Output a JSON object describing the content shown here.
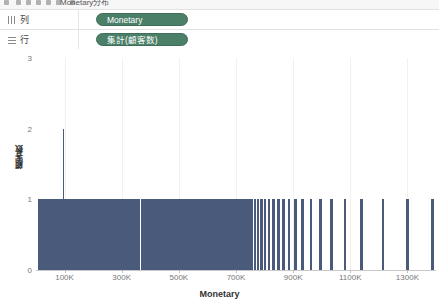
{
  "toolbar": {
    "title": "Monetary分布",
    "icons": [
      "menu-icon",
      "back-icon",
      "forward-icon",
      "save-icon",
      "undo-icon",
      "redo-icon",
      "new-sheet-icon"
    ]
  },
  "shelves": [
    {
      "label": "列",
      "icon": "columns-icon",
      "pill": "Monetary"
    },
    {
      "label": "行",
      "icon": "rows-icon",
      "pill": "集計(顧客数)"
    }
  ],
  "chart_data": {
    "type": "bar",
    "title": "",
    "xlabel": "Monetary",
    "ylabel": "顧客数",
    "xlim": [
      0,
      1400000
    ],
    "ylim": [
      0,
      3
    ],
    "grid": true,
    "legend": false,
    "bar_color": "#4a5a7a",
    "x_tick_labels": [
      "100K",
      "300K",
      "500K",
      "700K",
      "900K",
      "1100K",
      "1300K"
    ],
    "x_tick_values": [
      100000,
      300000,
      500000,
      700000,
      900000,
      1100000,
      1300000
    ],
    "y_tick_labels": [
      "0",
      "1",
      "2",
      "3"
    ],
    "y_tick_values": [
      0,
      1,
      2,
      3
    ],
    "note": "Histogram of distinct Monetary values; nearly all bins have count 1, one bin has count 2",
    "bars": [
      {
        "x": 8000,
        "w": 0.3,
        "y": 1
      },
      {
        "x": 11000,
        "w": 0.3,
        "y": 1
      },
      {
        "x": 14000,
        "w": 0.3,
        "y": 1
      },
      {
        "x": 17000,
        "w": 0.3,
        "y": 1
      },
      {
        "x": 20000,
        "w": 0.3,
        "y": 1
      },
      {
        "x": 23000,
        "w": 0.3,
        "y": 1
      },
      {
        "x": 26000,
        "w": 0.3,
        "y": 1
      },
      {
        "x": 29000,
        "w": 0.3,
        "y": 1
      },
      {
        "x": 32000,
        "w": 0.3,
        "y": 1
      },
      {
        "x": 35000,
        "w": 0.3,
        "y": 1
      },
      {
        "x": 38000,
        "w": 0.3,
        "y": 1
      },
      {
        "x": 41000,
        "w": 0.3,
        "y": 1
      },
      {
        "x": 44000,
        "w": 0.3,
        "y": 1
      },
      {
        "x": 47000,
        "w": 0.3,
        "y": 1
      },
      {
        "x": 50000,
        "w": 0.3,
        "y": 1
      },
      {
        "x": 53000,
        "w": 0.3,
        "y": 1
      },
      {
        "x": 56000,
        "w": 0.3,
        "y": 1
      },
      {
        "x": 59000,
        "w": 0.3,
        "y": 1
      },
      {
        "x": 62000,
        "w": 0.3,
        "y": 1
      },
      {
        "x": 65000,
        "w": 0.3,
        "y": 1
      },
      {
        "x": 68000,
        "w": 0.3,
        "y": 1
      },
      {
        "x": 71000,
        "w": 0.3,
        "y": 1
      },
      {
        "x": 74000,
        "w": 0.3,
        "y": 1
      },
      {
        "x": 77000,
        "w": 0.3,
        "y": 1
      },
      {
        "x": 80000,
        "w": 0.3,
        "y": 1
      },
      {
        "x": 83000,
        "w": 0.3,
        "y": 1
      },
      {
        "x": 86000,
        "w": 0.3,
        "y": 1
      },
      {
        "x": 89000,
        "w": 0.3,
        "y": 1
      },
      {
        "x": 92000,
        "w": 0.3,
        "y": 1
      },
      {
        "x": 95000,
        "w": 0.3,
        "y": 1
      },
      {
        "x": 98000,
        "w": 0.3,
        "y": 1
      },
      {
        "x": 101000,
        "w": 0.3,
        "y": 1
      },
      {
        "x": 104000,
        "w": 0.3,
        "y": 1
      },
      {
        "x": 107000,
        "w": 0.3,
        "y": 1
      },
      {
        "x": 110000,
        "w": 0.3,
        "y": 1
      },
      {
        "x": 113000,
        "w": 0.3,
        "y": 1
      },
      {
        "x": 116000,
        "w": 0.3,
        "y": 1
      },
      {
        "x": 119000,
        "w": 0.3,
        "y": 1
      },
      {
        "x": 122000,
        "w": 0.3,
        "y": 1
      },
      {
        "x": 125000,
        "w": 0.3,
        "y": 1
      },
      {
        "x": 128000,
        "w": 0.3,
        "y": 1
      },
      {
        "x": 131000,
        "w": 0.3,
        "y": 1
      },
      {
        "x": 134000,
        "w": 0.3,
        "y": 1
      },
      {
        "x": 137000,
        "w": 0.3,
        "y": 1
      },
      {
        "x": 140000,
        "w": 0.3,
        "y": 1
      },
      {
        "x": 143000,
        "w": 0.3,
        "y": 1
      },
      {
        "x": 146000,
        "w": 0.3,
        "y": 1
      },
      {
        "x": 149000,
        "w": 0.3,
        "y": 1
      },
      {
        "x": 152000,
        "w": 0.3,
        "y": 1
      },
      {
        "x": 155000,
        "w": 0.3,
        "y": 1
      },
      {
        "x": 158000,
        "w": 0.3,
        "y": 1
      },
      {
        "x": 161000,
        "w": 0.3,
        "y": 1
      },
      {
        "x": 164000,
        "w": 0.3,
        "y": 1
      },
      {
        "x": 167000,
        "w": 0.3,
        "y": 1
      },
      {
        "x": 170000,
        "w": 0.3,
        "y": 1
      },
      {
        "x": 173000,
        "w": 0.3,
        "y": 1
      },
      {
        "x": 176000,
        "w": 0.3,
        "y": 1
      },
      {
        "x": 179000,
        "w": 0.3,
        "y": 1
      },
      {
        "x": 182000,
        "w": 0.3,
        "y": 1
      },
      {
        "x": 185000,
        "w": 0.3,
        "y": 1
      },
      {
        "x": 188000,
        "w": 0.3,
        "y": 1
      },
      {
        "x": 191000,
        "w": 0.3,
        "y": 1
      },
      {
        "x": 194000,
        "w": 0.3,
        "y": 1
      },
      {
        "x": 197000,
        "w": 0.3,
        "y": 1
      },
      {
        "x": 200000,
        "w": 0.3,
        "y": 1
      },
      {
        "x": 203000,
        "w": 0.3,
        "y": 1
      },
      {
        "x": 206000,
        "w": 0.3,
        "y": 1
      },
      {
        "x": 209000,
        "w": 0.3,
        "y": 1
      },
      {
        "x": 212000,
        "w": 0.3,
        "y": 1
      },
      {
        "x": 215000,
        "w": 0.3,
        "y": 1
      },
      {
        "x": 218000,
        "w": 0.3,
        "y": 1
      },
      {
        "x": 221000,
        "w": 0.3,
        "y": 1
      },
      {
        "x": 224000,
        "w": 0.3,
        "y": 1
      },
      {
        "x": 227000,
        "w": 0.3,
        "y": 1
      },
      {
        "x": 230000,
        "w": 0.3,
        "y": 1
      },
      {
        "x": 233000,
        "w": 0.3,
        "y": 1
      },
      {
        "x": 236000,
        "w": 0.3,
        "y": 1
      },
      {
        "x": 239000,
        "w": 0.3,
        "y": 1
      },
      {
        "x": 242000,
        "w": 0.3,
        "y": 1
      },
      {
        "x": 245000,
        "w": 0.3,
        "y": 1
      },
      {
        "x": 248000,
        "w": 0.3,
        "y": 1
      },
      {
        "x": 251000,
        "w": 0.3,
        "y": 1
      },
      {
        "x": 254000,
        "w": 0.3,
        "y": 1
      },
      {
        "x": 257000,
        "w": 0.3,
        "y": 1
      },
      {
        "x": 260000,
        "w": 0.3,
        "y": 1
      },
      {
        "x": 263000,
        "w": 0.3,
        "y": 1
      },
      {
        "x": 266000,
        "w": 0.3,
        "y": 1
      },
      {
        "x": 269000,
        "w": 0.3,
        "y": 1
      },
      {
        "x": 272000,
        "w": 0.3,
        "y": 1
      },
      {
        "x": 275000,
        "w": 0.3,
        "y": 1
      },
      {
        "x": 278000,
        "w": 0.3,
        "y": 1
      },
      {
        "x": 281000,
        "w": 0.3,
        "y": 1
      },
      {
        "x": 284000,
        "w": 0.3,
        "y": 1
      },
      {
        "x": 287000,
        "w": 0.3,
        "y": 1
      },
      {
        "x": 290000,
        "w": 0.3,
        "y": 1
      },
      {
        "x": 293000,
        "w": 0.3,
        "y": 1
      },
      {
        "x": 296000,
        "w": 0.3,
        "y": 1
      },
      {
        "x": 299000,
        "w": 0.3,
        "y": 1
      },
      {
        "x": 302000,
        "w": 0.3,
        "y": 1
      },
      {
        "x": 305000,
        "w": 0.3,
        "y": 1
      },
      {
        "x": 308000,
        "w": 0.3,
        "y": 1
      },
      {
        "x": 311000,
        "w": 0.3,
        "y": 1
      },
      {
        "x": 314000,
        "w": 0.3,
        "y": 1
      },
      {
        "x": 317000,
        "w": 0.3,
        "y": 1
      },
      {
        "x": 320000,
        "w": 0.3,
        "y": 1
      },
      {
        "x": 323000,
        "w": 0.3,
        "y": 1
      },
      {
        "x": 326000,
        "w": 0.3,
        "y": 1
      },
      {
        "x": 329000,
        "w": 0.3,
        "y": 1
      },
      {
        "x": 332000,
        "w": 0.3,
        "y": 1
      },
      {
        "x": 335000,
        "w": 0.3,
        "y": 1
      },
      {
        "x": 338000,
        "w": 0.3,
        "y": 1
      },
      {
        "x": 341000,
        "w": 0.3,
        "y": 1
      },
      {
        "x": 344000,
        "w": 0.3,
        "y": 1
      },
      {
        "x": 347000,
        "w": 0.3,
        "y": 1
      },
      {
        "x": 350000,
        "w": 0.3,
        "y": 1
      },
      {
        "x": 353000,
        "w": 0.3,
        "y": 1
      },
      {
        "x": 356000,
        "w": 0.3,
        "y": 1
      },
      {
        "x": 359000,
        "w": 0.3,
        "y": 1
      },
      {
        "x": 362000,
        "w": 0.3,
        "y": 1
      },
      {
        "x": 97000,
        "w": 0.3,
        "y": 2
      },
      {
        "x": 372000,
        "w": 0.9,
        "y": 1
      },
      {
        "x": 378000,
        "w": 0.9,
        "y": 1
      },
      {
        "x": 385000,
        "w": 1.8,
        "y": 1
      },
      {
        "x": 392000,
        "w": 0.9,
        "y": 1
      },
      {
        "x": 399000,
        "w": 2.5,
        "y": 1
      },
      {
        "x": 408000,
        "w": 1.5,
        "y": 1
      },
      {
        "x": 414000,
        "w": 0.9,
        "y": 1
      },
      {
        "x": 421000,
        "w": 2.0,
        "y": 1
      },
      {
        "x": 430000,
        "w": 0.9,
        "y": 1
      },
      {
        "x": 437000,
        "w": 1.5,
        "y": 1
      },
      {
        "x": 445000,
        "w": 0.9,
        "y": 1
      },
      {
        "x": 452000,
        "w": 2.2,
        "y": 1
      },
      {
        "x": 461000,
        "w": 0.9,
        "y": 1
      },
      {
        "x": 468000,
        "w": 1.4,
        "y": 1
      },
      {
        "x": 475000,
        "w": 0.9,
        "y": 1
      },
      {
        "x": 482000,
        "w": 2.0,
        "y": 1
      },
      {
        "x": 490000,
        "w": 0.9,
        "y": 1
      },
      {
        "x": 497000,
        "w": 1.3,
        "y": 1
      },
      {
        "x": 504000,
        "w": 0.9,
        "y": 1
      },
      {
        "x": 511000,
        "w": 1.8,
        "y": 1
      },
      {
        "x": 519000,
        "w": 0.9,
        "y": 1
      },
      {
        "x": 526000,
        "w": 1.2,
        "y": 1
      },
      {
        "x": 533000,
        "w": 0.9,
        "y": 1
      },
      {
        "x": 540000,
        "w": 1.6,
        "y": 1
      },
      {
        "x": 548000,
        "w": 0.9,
        "y": 1
      },
      {
        "x": 555000,
        "w": 1.0,
        "y": 1
      },
      {
        "x": 562000,
        "w": 0.9,
        "y": 1
      },
      {
        "x": 569000,
        "w": 1.4,
        "y": 1
      },
      {
        "x": 577000,
        "w": 0.9,
        "y": 1
      },
      {
        "x": 584000,
        "w": 1.0,
        "y": 1
      },
      {
        "x": 591000,
        "w": 0.9,
        "y": 1
      },
      {
        "x": 598000,
        "w": 1.2,
        "y": 1
      },
      {
        "x": 606000,
        "w": 0.9,
        "y": 1
      },
      {
        "x": 613000,
        "w": 0.9,
        "y": 1
      },
      {
        "x": 620000,
        "w": 0.9,
        "y": 1
      },
      {
        "x": 627000,
        "w": 1.0,
        "y": 1
      },
      {
        "x": 635000,
        "w": 0.9,
        "y": 1
      },
      {
        "x": 642000,
        "w": 0.9,
        "y": 1
      },
      {
        "x": 649000,
        "w": 0.9,
        "y": 1
      },
      {
        "x": 656000,
        "w": 0.9,
        "y": 1
      },
      {
        "x": 664000,
        "w": 0.9,
        "y": 1
      },
      {
        "x": 671000,
        "w": 0.9,
        "y": 1
      },
      {
        "x": 678000,
        "w": 0.9,
        "y": 1
      },
      {
        "x": 686000,
        "w": 0.9,
        "y": 1
      },
      {
        "x": 694000,
        "w": 0.9,
        "y": 1
      },
      {
        "x": 702000,
        "w": 0.9,
        "y": 1
      },
      {
        "x": 710000,
        "w": 0.9,
        "y": 1
      },
      {
        "x": 718000,
        "w": 0.9,
        "y": 1
      },
      {
        "x": 727000,
        "w": 0.9,
        "y": 1
      },
      {
        "x": 736000,
        "w": 0.9,
        "y": 1
      },
      {
        "x": 745000,
        "w": 0.9,
        "y": 1
      },
      {
        "x": 755000,
        "w": 0.9,
        "y": 1
      },
      {
        "x": 766000,
        "w": 0.9,
        "y": 1
      },
      {
        "x": 777000,
        "w": 0.9,
        "y": 1
      },
      {
        "x": 789000,
        "w": 0.9,
        "y": 1
      },
      {
        "x": 802000,
        "w": 0.9,
        "y": 1
      },
      {
        "x": 816000,
        "w": 0.9,
        "y": 1
      },
      {
        "x": 831000,
        "w": 0.9,
        "y": 1
      },
      {
        "x": 848000,
        "w": 0.9,
        "y": 1
      },
      {
        "x": 866000,
        "w": 0.9,
        "y": 1
      },
      {
        "x": 886000,
        "w": 0.9,
        "y": 1
      },
      {
        "x": 908000,
        "w": 0.9,
        "y": 1
      },
      {
        "x": 933000,
        "w": 0.9,
        "y": 1
      },
      {
        "x": 962000,
        "w": 0.9,
        "y": 1
      },
      {
        "x": 996000,
        "w": 0.9,
        "y": 1
      },
      {
        "x": 1035000,
        "w": 0.9,
        "y": 1
      },
      {
        "x": 1082000,
        "w": 0.9,
        "y": 1
      },
      {
        "x": 1140000,
        "w": 0.9,
        "y": 1
      },
      {
        "x": 1215000,
        "w": 0.9,
        "y": 1
      },
      {
        "x": 1300000,
        "w": 0.9,
        "y": 1
      },
      {
        "x": 1388000,
        "w": 0.9,
        "y": 1
      }
    ]
  }
}
